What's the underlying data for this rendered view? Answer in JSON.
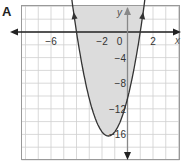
{
  "panel_label": "A",
  "chart_data": {
    "type": "line",
    "title": "",
    "xlabel": "x",
    "ylabel": "y",
    "xlim": [
      -8,
      4
    ],
    "ylim": [
      -20,
      4
    ],
    "grid": true,
    "x_ticks": [
      "-6",
      "-2",
      "0",
      "2"
    ],
    "y_ticks": [
      "-4",
      "-8",
      "-12",
      "-16"
    ],
    "series": [
      {
        "name": "parabola",
        "description": "upward-opening parabola, roots at x=-4 and x=1, vertex near (-1.5, -16.25), region inside/above curve shaded",
        "x": [
          -4.3,
          -4,
          -3,
          -2,
          -1.5,
          -1,
          0,
          1,
          1.3
        ],
        "y": [
          3.7,
          0,
          -10.4,
          -15.6,
          -16.25,
          -15.6,
          -10.4,
          0,
          3.7
        ]
      }
    ],
    "shading": "region above the parabola (y >= curve) shaded gray",
    "colors": {
      "curve": "#333333",
      "shade": "#dcdcdc",
      "grid": "#c8c8c8",
      "axis": "#222222"
    }
  }
}
